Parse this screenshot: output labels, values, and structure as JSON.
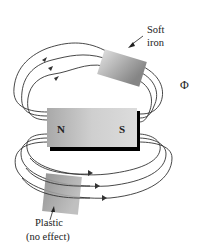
{
  "figure": {
    "magnet": {
      "north_label": "N",
      "south_label": "S",
      "colors": {
        "body_light": "#d8d8d8",
        "body_dark": "#a8a8a8",
        "shadow": "#000000"
      }
    },
    "soft_iron": {
      "label_line1": "Soft",
      "label_line2": "iron",
      "colors": {
        "light": "#d9d9d9",
        "dark": "#8a8a8a"
      }
    },
    "plastic": {
      "label_line1": "Plastic",
      "label_line2": "(no effect)",
      "colors": {
        "light": "#b0b0b0",
        "dark": "#7e7e7e"
      }
    },
    "flux_symbol": "Φ",
    "field_line_color": "#333333"
  }
}
